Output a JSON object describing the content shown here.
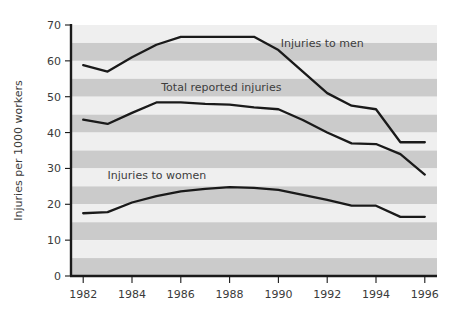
{
  "chart_data": {
    "type": "line",
    "title": "",
    "subtitle": "",
    "xlabel": "",
    "ylabel": "Injuries per 1000 workers",
    "xlim": [
      1981.5,
      1996.5
    ],
    "ylim": [
      0,
      70
    ],
    "grid": "horizontal-banded",
    "legend_position": "inline-annotations",
    "x": [
      1982,
      1983,
      1984,
      1985,
      1986,
      1987,
      1988,
      1989,
      1990,
      1991,
      1992,
      1993,
      1994,
      1995,
      1996
    ],
    "xtick_labels": [
      "1982",
      "1984",
      "1986",
      "1988",
      "1990",
      "1992",
      "1994",
      "1996"
    ],
    "xticks": [
      1982,
      1984,
      1986,
      1988,
      1990,
      1992,
      1994,
      1996
    ],
    "ytick_labels": [
      "0",
      "10",
      "20",
      "30",
      "40",
      "50",
      "60",
      "70"
    ],
    "yticks": [
      0,
      10,
      20,
      30,
      40,
      50,
      60,
      70
    ],
    "series": [
      {
        "name": "Injuries to men",
        "label_x": 1990.1,
        "label_y": 64.0,
        "values": [
          58.8,
          57.0,
          61.0,
          64.5,
          66.7,
          66.7,
          66.7,
          66.7,
          63.0,
          57.0,
          51.0,
          47.5,
          46.5,
          37.3,
          37.3
        ]
      },
      {
        "name": "Total reported injuries",
        "label_x": 1985.2,
        "label_y": 51.5,
        "values": [
          43.6,
          42.4,
          45.5,
          48.4,
          48.4,
          48.0,
          47.8,
          47.0,
          46.5,
          43.5,
          40.0,
          37.0,
          36.8,
          34.0,
          28.3
        ]
      },
      {
        "name": "Injuries to women",
        "label_x": 1983.0,
        "label_y": 27.0,
        "values": [
          17.5,
          17.8,
          20.5,
          22.3,
          23.6,
          24.3,
          24.8,
          24.6,
          24.0,
          22.6,
          21.2,
          19.6,
          19.6,
          16.5,
          16.5
        ]
      }
    ]
  },
  "axis": {
    "y_title": "Injuries per 1000 workers"
  },
  "style": {
    "band_light": "#efefef",
    "band_dark": "#cbcbcb",
    "line_color": "#1a1a1a",
    "axis_color": "#1a1a1a",
    "page_background": "#ffffff"
  }
}
